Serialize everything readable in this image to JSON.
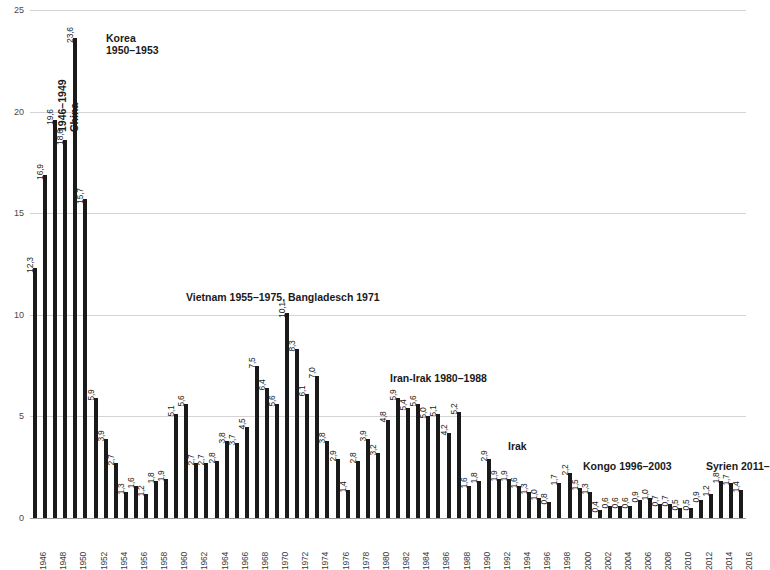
{
  "chart_data": {
    "type": "bar",
    "title": "",
    "subtitle": "",
    "xlabel": "",
    "ylabel": "",
    "ylim": [
      0,
      25
    ],
    "yticks": [
      0,
      5,
      10,
      15,
      20,
      25
    ],
    "grid": true,
    "legend": "none",
    "bar_color": "#1a1a1a",
    "x": [
      1946,
      1947,
      1948,
      1949,
      1950,
      1951,
      1952,
      1953,
      1954,
      1955,
      1956,
      1957,
      1958,
      1959,
      1960,
      1961,
      1962,
      1963,
      1964,
      1965,
      1966,
      1967,
      1968,
      1969,
      1970,
      1971,
      1972,
      1973,
      1974,
      1975,
      1976,
      1977,
      1978,
      1979,
      1980,
      1981,
      1982,
      1983,
      1984,
      1985,
      1986,
      1987,
      1988,
      1989,
      1990,
      1991,
      1992,
      1993,
      1994,
      1995,
      1996,
      1997,
      1998,
      1999,
      2000,
      2001,
      2002,
      2003,
      2004,
      2005,
      2006,
      2007,
      2008,
      2009,
      2010,
      2011,
      2012,
      2013,
      2014,
      2015,
      2016
    ],
    "values": [
      12.3,
      16.9,
      19.6,
      18.6,
      23.6,
      15.7,
      5.9,
      3.9,
      2.7,
      1.3,
      1.6,
      1.2,
      1.8,
      1.9,
      5.1,
      5.6,
      2.7,
      2.7,
      2.8,
      3.8,
      3.7,
      4.5,
      7.5,
      6.4,
      5.6,
      10.1,
      8.3,
      6.1,
      7.0,
      3.8,
      2.9,
      1.4,
      2.8,
      3.9,
      3.2,
      4.8,
      5.9,
      5.4,
      5.6,
      5.0,
      5.1,
      4.2,
      5.2,
      1.6,
      1.8,
      2.9,
      1.9,
      1.9,
      1.6,
      1.3,
      1.0,
      0.8,
      1.7,
      2.2,
      1.5,
      1.3,
      0.4,
      0.6,
      0.6,
      0.6,
      0.9,
      1.0,
      0.7,
      0.7,
      0.5,
      0.5,
      0.9,
      1.2,
      1.8,
      1.7,
      1.4
    ],
    "value_labels": [
      "12,3",
      "16,9",
      "19,6",
      "18,6",
      "23,6",
      "15,7",
      "5,9",
      "3,9",
      "2,7",
      "1,3",
      "1,6",
      "1,2",
      "1,8",
      "1,9",
      "5,1",
      "5,6",
      "2,7",
      "2,7",
      "2,8",
      "3,8",
      "3,7",
      "4,5",
      "7,5",
      "6,4",
      "5,6",
      "10,1",
      "8,3",
      "6,1",
      "7,0",
      "3,8",
      "2,9",
      "1,4",
      "2,8",
      "3,9",
      "3,2",
      "4,8",
      "5,9",
      "5,4",
      "5,6",
      "5,0",
      "5,1",
      "4,2",
      "5,2",
      "1,6",
      "1,8",
      "2,9",
      "1,9",
      "1,9",
      "1,6",
      "1,3",
      "1,0",
      "0,8",
      "1,7",
      "2,2",
      "1,5",
      "1,3",
      "0,4",
      "0,6",
      "0,6",
      "0,6",
      "0,9",
      "1,0",
      "0,7",
      "0,7",
      "0,5",
      "0,5",
      "0,9",
      "1,2",
      "1,8",
      "1,7",
      "1,4"
    ],
    "xtick_labels": [
      "1946",
      "1948",
      "1950",
      "1952",
      "1954",
      "1956",
      "1958",
      "1960",
      "1962",
      "1964",
      "1966",
      "1968",
      "1970",
      "1972",
      "1974",
      "1976",
      "1978",
      "1980",
      "1982",
      "1984",
      "1986",
      "1988",
      "1990",
      "1992",
      "1994",
      "1996",
      "1998",
      "2000",
      "2002",
      "2004",
      "2006",
      "2008",
      "2010",
      "2012",
      "2014",
      "2016"
    ],
    "xtick_years": [
      1946,
      1948,
      1950,
      1952,
      1954,
      1956,
      1958,
      1960,
      1962,
      1964,
      1966,
      1968,
      1970,
      1972,
      1974,
      1976,
      1978,
      1980,
      1982,
      1984,
      1986,
      1988,
      1990,
      1992,
      1994,
      1996,
      1998,
      2000,
      2002,
      2004,
      2006,
      2008,
      2010,
      2012,
      2014,
      2016
    ],
    "ytick_labels": [
      "0",
      "5",
      "10",
      "15",
      "20",
      "25"
    ],
    "annotations": [
      {
        "id": "china",
        "text": "China\n1946–1949",
        "orientation": "vertical",
        "x_px": 26,
        "y_px": 122
      },
      {
        "id": "korea",
        "text": "Korea\n1950–1953",
        "orientation": "horizontal",
        "x_px": 76,
        "y_px": 22
      },
      {
        "id": "vietnam",
        "text": "Vietnam 1955–1975, Bangladesch 1971",
        "orientation": "horizontal",
        "x_px": 156,
        "y_px": 281
      },
      {
        "id": "iran-irak",
        "text": "Iran-Irak 1980–1988",
        "orientation": "horizontal",
        "x_px": 360,
        "y_px": 362
      },
      {
        "id": "irak",
        "text": "Irak",
        "orientation": "horizontal",
        "x_px": 478,
        "y_px": 430
      },
      {
        "id": "kongo",
        "text": "Kongo 1996–2003",
        "orientation": "horizontal",
        "x_px": 553,
        "y_px": 450
      },
      {
        "id": "syrien",
        "text": "Syrien 2011–",
        "orientation": "horizontal",
        "x_px": 676,
        "y_px": 450
      }
    ]
  }
}
